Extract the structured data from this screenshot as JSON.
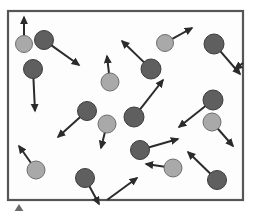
{
  "figure": {
    "canvas": {
      "width": 255,
      "height": 217
    }
  },
  "colors": {
    "background": "#ffffff",
    "container_fill": "#fdfdfd",
    "container_border": "#565656",
    "particle_dark": "#5f5f5f",
    "particle_dark_stroke": "#3c3c3c",
    "particle_light": "#a9a9a9",
    "particle_light_stroke": "#6f6f6f",
    "arrow": "#2b2b2b",
    "legend_marker": "#6b6b6b"
  },
  "container": {
    "label": "container-wall",
    "x": 8,
    "y": 11,
    "width": 235,
    "height": 189,
    "border_width": 2.2
  },
  "legend_marker": {
    "label": "pointer-triangle",
    "x": 19,
    "y": 211,
    "size": 7
  },
  "chart_data": {
    "type": "scatter",
    "subtitle": "",
    "xlabel": "",
    "ylabel": "",
    "xlim": [
      8,
      243
    ],
    "ylim": [
      11,
      200
    ],
    "grid": false,
    "legend_position": "none",
    "series": [
      {
        "name": "dark particles",
        "color": "#5f5f5f",
        "count": 11
      },
      {
        "name": "light particles",
        "color": "#a9a9a9",
        "count": 8
      }
    ],
    "particles": [
      {
        "id": 1,
        "shade": "light",
        "cx": 24,
        "cy": 44,
        "r": 8.5,
        "vx": 0,
        "vy": -27
      },
      {
        "id": 2,
        "shade": "dark",
        "cx": 44,
        "cy": 40,
        "r": 9.5,
        "vx": 35,
        "vy": 25
      },
      {
        "id": 3,
        "shade": "dark",
        "cx": 33,
        "cy": 69,
        "r": 9.5,
        "vx": 2,
        "vy": 42
      },
      {
        "id": 4,
        "shade": "light",
        "cx": 110,
        "cy": 82,
        "r": 9,
        "vx": -3,
        "vy": -26
      },
      {
        "id": 5,
        "shade": "dark",
        "cx": 151,
        "cy": 69,
        "r": 10,
        "vx": -29,
        "vy": -28
      },
      {
        "id": 6,
        "shade": "light",
        "cx": 165,
        "cy": 43,
        "r": 8.5,
        "vx": 27,
        "vy": -15
      },
      {
        "id": 7,
        "shade": "dark",
        "cx": 214,
        "cy": 44,
        "r": 10,
        "vx": 26,
        "vy": 30
      },
      {
        "id": 8,
        "shade": "dark",
        "cx": 87,
        "cy": 111,
        "r": 9.5,
        "vx": -29,
        "vy": 26
      },
      {
        "id": 9,
        "shade": "light",
        "cx": 107,
        "cy": 124,
        "r": 9,
        "vx": -6,
        "vy": 24
      },
      {
        "id": 10,
        "shade": "dark",
        "cx": 134,
        "cy": 117,
        "r": 10,
        "vx": 29,
        "vy": -37
      },
      {
        "id": 11,
        "shade": "dark",
        "cx": 213,
        "cy": 100,
        "r": 10,
        "vx": -34,
        "vy": 27
      },
      {
        "id": 12,
        "shade": "light",
        "cx": 212,
        "cy": 122,
        "r": 9,
        "vx": 21,
        "vy": 24
      },
      {
        "id": 13,
        "shade": "light",
        "cx": 36,
        "cy": 170,
        "r": 9,
        "vx": -17,
        "vy": -24
      },
      {
        "id": 14,
        "shade": "dark",
        "cx": 85,
        "cy": 178,
        "r": 9.5,
        "vx": 14,
        "vy": 26
      },
      {
        "id": 15,
        "shade": "dark",
        "cx": 140,
        "cy": 150,
        "r": 9.5,
        "vx": 38,
        "vy": -11
      },
      {
        "id": 16,
        "shade": "light",
        "cx": 173,
        "cy": 168,
        "r": 9,
        "vx": -27,
        "vy": -4
      },
      {
        "id": 17,
        "shade": "dark",
        "cx": 217,
        "cy": 180,
        "r": 9.5,
        "vx": -29,
        "vy": -28
      },
      {
        "id": 18,
        "shade": "dark",
        "cx": 107,
        "cy": 200,
        "r": 0,
        "vx": 30,
        "vy": -22
      },
      {
        "id": 19,
        "shade": "dark",
        "cx": 243,
        "cy": 63,
        "r": 0,
        "vx": -8,
        "vy": 6
      }
    ]
  }
}
